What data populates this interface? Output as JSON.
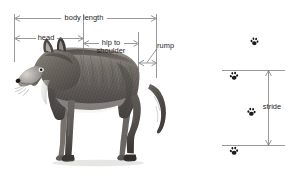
{
  "figure": {
    "background_color": "#ffffff",
    "line_color": "#5b5f63",
    "text_color": "#232323"
  },
  "subject": {
    "name": "wolf-illustration",
    "description": "Side view pencil drawing of a standing wolf facing left"
  },
  "measurements": [
    {
      "id": "body-length",
      "label": "body length"
    },
    {
      "id": "head",
      "label": "head"
    },
    {
      "id": "hip-to-shoulder",
      "label_line1": "hip to",
      "label_line2": "shoulder"
    },
    {
      "id": "rump",
      "label": "rump"
    },
    {
      "id": "stride",
      "label": "stride"
    }
  ],
  "tracks": {
    "name": "paw-prints",
    "count": 4,
    "items": [
      {
        "id": "paw-print-1",
        "position": "top, right of column"
      },
      {
        "id": "paw-print-2",
        "position": "at upper stride line"
      },
      {
        "id": "paw-print-3",
        "position": "mid, between stride lines"
      },
      {
        "id": "paw-print-4",
        "position": "at lower stride line"
      }
    ]
  }
}
